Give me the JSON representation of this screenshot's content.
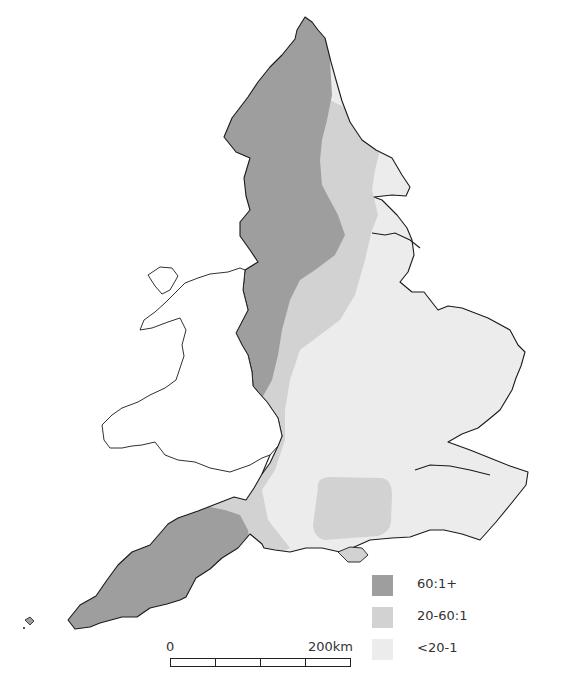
{
  "map": {
    "region": "England and Wales",
    "colors": {
      "band_high": "#9e9e9e",
      "band_mid": "#d2d2d2",
      "band_low": "#ececec",
      "wales": "#ffffff",
      "coastline": "#1a1a1a",
      "background": "#ffffff"
    }
  },
  "legend": {
    "items": [
      {
        "label": "60:1+",
        "color": "#9e9e9e"
      },
      {
        "label": "20-60:1",
        "color": "#d2d2d2"
      },
      {
        "label": "<20-1",
        "color": "#ececec"
      }
    ]
  },
  "scale_bar": {
    "start_label": "0",
    "end_label": "200km",
    "segments": 4
  }
}
